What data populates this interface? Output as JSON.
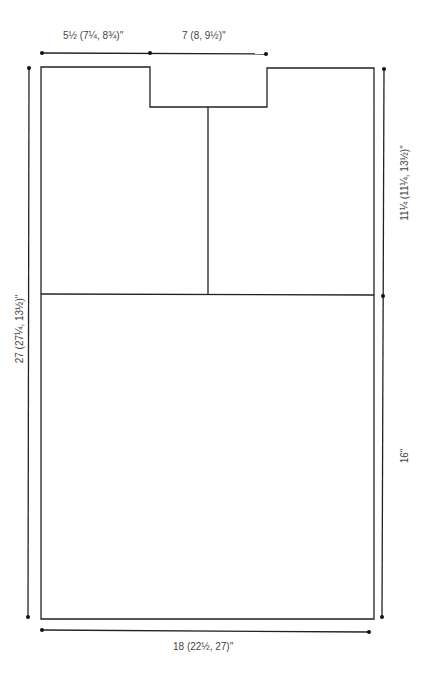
{
  "diagram": {
    "type": "garment-schematic",
    "stroke_color": "#222222",
    "label_color": "#444444",
    "labels": {
      "shoulder_width": "5½ (7¼, 8¾)\"",
      "neck_width": "7 (8, 9½)\"",
      "total_length": "27 (27¼, 13½)\"",
      "upper_length": "11¼ (11¼, 13½)\"",
      "lower_length": "16\"",
      "bottom_width": "18 (22½, 27)\""
    },
    "pieces": [
      {
        "name": "upper-left-panel"
      },
      {
        "name": "upper-right-panel"
      },
      {
        "name": "lower-panel"
      }
    ]
  }
}
